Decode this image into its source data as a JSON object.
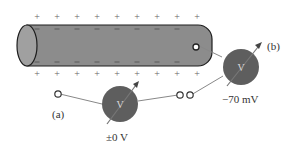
{
  "diagram": {
    "signs": {
      "outside": "+",
      "inside": "−"
    },
    "meter_symbol": "V",
    "panels": [
      {
        "label": "(a)",
        "reading": "±0 V",
        "description": "both electrodes outside the membrane"
      },
      {
        "label": "(b)",
        "reading": "−70 mV",
        "description": "one electrode inside the axon"
      }
    ],
    "colors": {
      "axon_fill": "#8c8c8c",
      "axon_end": "#a0a0a0",
      "axon_outline": "#1e1e1e",
      "meter_fill": "#5e5e5e",
      "wire": "#888888",
      "text": "#333333"
    }
  }
}
